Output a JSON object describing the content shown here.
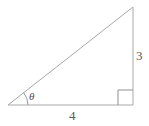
{
  "figure": {
    "type": "geometry-diagram",
    "stroke_color": "#a8a8a8",
    "text_color": "#5a5a5a",
    "background_color": "#ffffff",
    "labels": {
      "opposite_side": "3",
      "adjacent_side": "4",
      "angle": "θ"
    },
    "geometry": {
      "vertices": {
        "left": [
          8,
          105
        ],
        "right_angle": [
          133,
          105
        ],
        "apex": [
          133,
          7
        ]
      },
      "right_angle_marker_size": 15,
      "angle_arc_radius": 20
    }
  }
}
